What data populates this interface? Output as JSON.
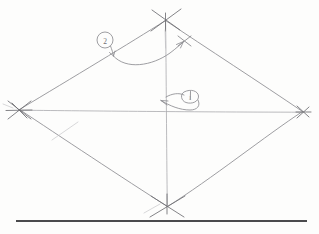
{
  "canvas": {
    "width": 319,
    "height": 234,
    "background_color": "#fdfdfc",
    "medium": "pencil-on-paper",
    "title": "Hand-drawn kite diagram with diagonals and annotations"
  },
  "palette": {
    "pencil": "#8d8d91",
    "pencil_light": "#a9a9ad",
    "pencil_dark": "#6e6e73",
    "ink_rule": "#4a4a4d",
    "paper": "#fdfdfc"
  },
  "figure": {
    "name": "kite-quadrilateral",
    "vertices": [
      {
        "id": "top",
        "label": "top-vertex",
        "x": 165,
        "y": 20,
        "marker": "x-cross"
      },
      {
        "id": "right",
        "label": "right-vertex",
        "x": 303,
        "y": 112,
        "marker": "x-cross"
      },
      {
        "id": "bottom",
        "label": "bottom-vertex",
        "x": 167,
        "y": 207,
        "marker": "x-cross"
      },
      {
        "id": "left",
        "label": "left-vertex",
        "x": 18,
        "y": 110,
        "marker": "x-cross"
      }
    ],
    "edges": [
      {
        "id": "edge-top-left",
        "from": "top",
        "to": "left"
      },
      {
        "id": "edge-top-right",
        "from": "top",
        "to": "right"
      },
      {
        "id": "edge-bottom-right",
        "from": "right",
        "to": "bottom"
      },
      {
        "id": "edge-bottom-left",
        "from": "bottom",
        "to": "left"
      }
    ],
    "diagonals": [
      {
        "id": "diagonal-horizontal",
        "from": "left",
        "to": "right",
        "orientation": "horizontal"
      },
      {
        "id": "diagonal-vertical",
        "from": "top",
        "to": "bottom",
        "orientation": "vertical"
      }
    ],
    "intersection": {
      "id": "center-point",
      "label": "diagonal-intersection",
      "x": 166,
      "y": 111
    }
  },
  "annotations": [
    {
      "id": "callout-2",
      "label_text": "2",
      "shape": "circled-number",
      "circle": {
        "cx": 105,
        "cy": 40,
        "r": 8
      },
      "pointer_target": {
        "x": 113,
        "y": 55
      },
      "description": "circled numeral two with short arrow to upper-left edge"
    },
    {
      "id": "callout-1",
      "label_text": "1",
      "shape": "circled-number",
      "circle": {
        "cx": 190,
        "cy": 97,
        "r": 7
      },
      "pointer_target": {
        "x": 160,
        "y": 100
      },
      "description": "circled numeral one with arrow pointing left toward the diagonal intersection"
    }
  ],
  "marks": [
    {
      "id": "sweep-arc",
      "type": "curved-arrow",
      "from": {
        "x": 113,
        "y": 56
      },
      "to": {
        "x": 184,
        "y": 41
      },
      "description": "long shallow arc sweeping from the left edge across to the tick on the upper-right edge"
    },
    {
      "id": "edge-tick",
      "type": "cross-tick",
      "x": 184,
      "y": 41,
      "description": "small cross tick marking a point on the upper-right edge"
    }
  ],
  "baseline_rule": {
    "id": "bottom-rule",
    "x1": 16,
    "x2": 307,
    "y": 221,
    "thickness": 2,
    "color": "#4a4a4d",
    "description": "solid ruled horizontal line near the bottom of the sheet"
  }
}
